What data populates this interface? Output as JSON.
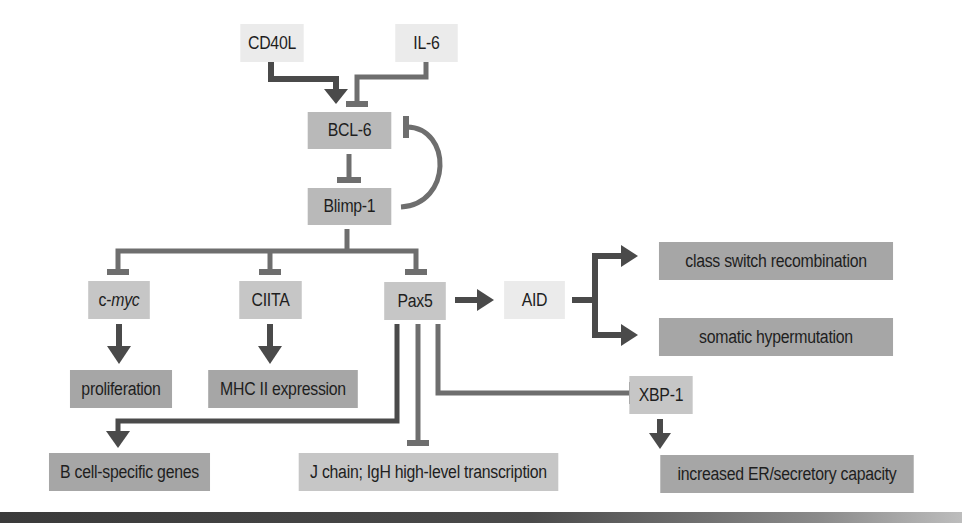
{
  "diagram": {
    "title": "",
    "colors": {
      "activation_arrow": "#4a4a4a",
      "inhibition_line": "#6e6e6e",
      "input_node": "#ebebeb",
      "regulator_node": "#b9b9b9",
      "target_node": "#c6c6c6",
      "outcome_node": "#a6a6a6",
      "bottom_bar": "#3a3a3a"
    },
    "nodes": {
      "cd40l": "CD40L",
      "il6": "IL-6",
      "bcl6": "BCL-6",
      "blimp1": "Blimp-1",
      "cmyc_prefix": "c-",
      "cmyc_italic": "myc",
      "ciita": "CIITA",
      "pax5": "Pax5",
      "aid": "AID",
      "class_switch": "class switch recombination",
      "somatic_hypermutation": "somatic hypermutation",
      "proliferation": "proliferation",
      "mhc2": "MHC II expression",
      "xbp1": "XBP-1",
      "bcell_genes": "B cell-specific genes",
      "jchain": "J chain; IgH high-level transcription",
      "er_capacity": "increased ER/secretory capacity"
    },
    "edges": [
      {
        "from": "CD40L",
        "to": "BCL-6",
        "type": "activates"
      },
      {
        "from": "IL-6",
        "to": "BCL-6",
        "type": "inhibits"
      },
      {
        "from": "BCL-6",
        "to": "Blimp-1",
        "type": "inhibits"
      },
      {
        "from": "Blimp-1",
        "to": "BCL-6",
        "type": "inhibits"
      },
      {
        "from": "Blimp-1",
        "to": "c-myc",
        "type": "inhibits"
      },
      {
        "from": "Blimp-1",
        "to": "CIITA",
        "type": "inhibits"
      },
      {
        "from": "Blimp-1",
        "to": "Pax5",
        "type": "inhibits"
      },
      {
        "from": "c-myc",
        "to": "proliferation",
        "type": "activates"
      },
      {
        "from": "CIITA",
        "to": "MHC II expression",
        "type": "activates"
      },
      {
        "from": "Pax5",
        "to": "AID",
        "type": "activates"
      },
      {
        "from": "AID",
        "to": "class switch recombination",
        "type": "activates"
      },
      {
        "from": "AID",
        "to": "somatic hypermutation",
        "type": "activates"
      },
      {
        "from": "Pax5",
        "to": "B cell-specific genes",
        "type": "activates"
      },
      {
        "from": "Pax5",
        "to": "J chain; IgH high-level transcription",
        "type": "inhibits"
      },
      {
        "from": "Pax5",
        "to": "XBP-1",
        "type": "inhibits"
      },
      {
        "from": "XBP-1",
        "to": "increased ER/secretory capacity",
        "type": "activates"
      }
    ]
  }
}
